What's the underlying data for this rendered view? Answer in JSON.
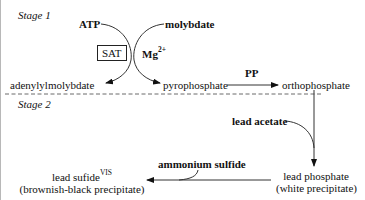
{
  "stage1": {
    "label": "Stage 1",
    "atp": "ATP",
    "molybdate": "molybdate",
    "enzyme": "SAT",
    "cofactor": "Mg",
    "cofactor_charge": "2+",
    "product_left": "adenylylmolybdate",
    "product_right": "pyrophosphate",
    "pp_label": "PP",
    "orthophosphate": "orthophosphate"
  },
  "stage2": {
    "label": "Stage 2",
    "reagent1": "lead acetate",
    "product1_line1": "lead phosphate",
    "product1_line2": "(white precipitate)",
    "reagent2": "ammonium sulfide",
    "product2_line1": "lead sufide",
    "product2_superscript": "VIS",
    "product2_line2": "(brownish-black precipitate)"
  }
}
